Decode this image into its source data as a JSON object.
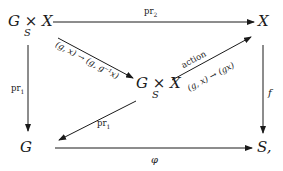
{
  "diagram": {
    "type": "commutative-diagram",
    "nodes": {
      "top_left": {
        "main": "G × X",
        "subscript": "S"
      },
      "top_right": {
        "main": "X"
      },
      "center": {
        "main": "G × X",
        "subscript": "S"
      },
      "bottom_left": {
        "main": "G"
      },
      "bottom_right": {
        "main": "S,"
      }
    },
    "edges": {
      "top": {
        "from": "top_left",
        "to": "top_right",
        "label": "pr",
        "label_sub": "2"
      },
      "left": {
        "from": "top_left",
        "to": "bottom_left",
        "label": "pr",
        "label_sub": "1"
      },
      "right": {
        "from": "top_right",
        "to": "bottom_right",
        "label": "f"
      },
      "bottom": {
        "from": "bottom_left",
        "to": "bottom_right",
        "label": "φ"
      },
      "diag_in": {
        "from": "top_left",
        "to": "center",
        "label": "(g, x) → (g, g⁻¹x)"
      },
      "diag_action": {
        "from": "center",
        "to": "top_right",
        "label_above": "action",
        "label_below": "(g, x) → (gx)"
      },
      "diag_pr1": {
        "from": "center",
        "to": "bottom_left",
        "label": "pr",
        "label_sub": "1"
      }
    },
    "colors": {
      "ink": "#1a1a1a",
      "background": "#ffffff"
    }
  }
}
